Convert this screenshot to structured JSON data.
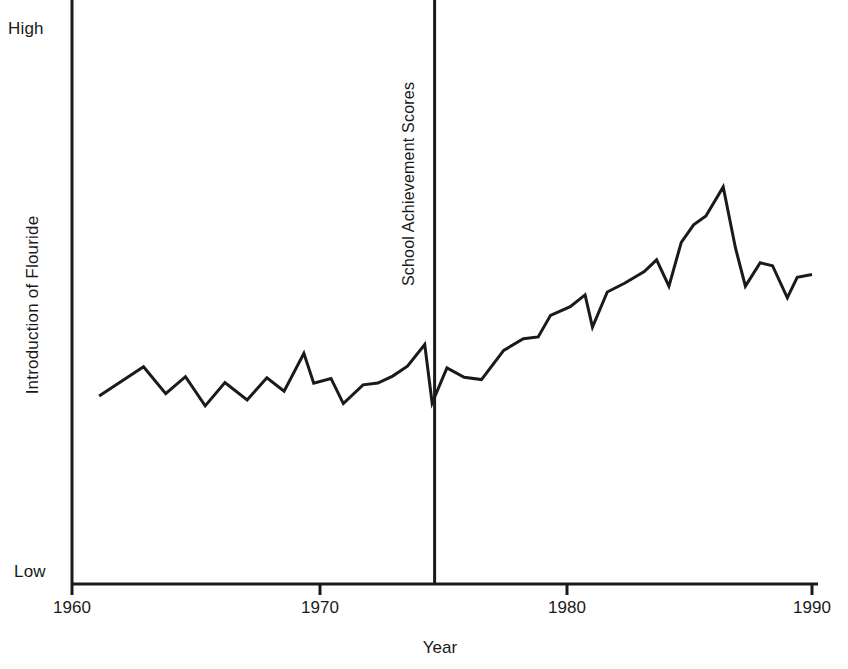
{
  "chart_data": {
    "type": "line",
    "title": "",
    "subtitle": "",
    "xlabel": "Year",
    "ylabel": "Introduction of Flouride",
    "xlim": [
      1960,
      1990
    ],
    "ylim": [
      0,
      100
    ],
    "ytick_labels": [
      "High",
      "Low"
    ],
    "ytick_values": [
      100,
      0
    ],
    "xtick_labels": [
      "1960",
      "1970",
      "1980",
      "1990"
    ],
    "xtick_values": [
      1960,
      1970,
      1980,
      1990
    ],
    "grid": false,
    "legend": "none",
    "series": [
      {
        "name": "School Achievement Scores",
        "x": [
          1961.1,
          1962.9,
          1963.8,
          1964.6,
          1965.4,
          1966.2,
          1967.1,
          1967.9,
          1968.6,
          1969.4,
          1969.8,
          1970.5,
          1971.0,
          1971.8,
          1972.4,
          1973.0,
          1973.6,
          1974.3,
          1974.6,
          1975.2,
          1975.9,
          1976.6,
          1977.5,
          1978.3,
          1978.9,
          1979.4,
          1980.2,
          1980.8,
          1981.1,
          1981.7,
          1982.4,
          1983.2,
          1983.7,
          1984.2,
          1984.7,
          1985.2,
          1985.7,
          1986.4,
          1986.9,
          1987.3,
          1987.9,
          1988.4,
          1989.0,
          1989.4,
          1990.0
        ],
        "y": [
          32.2,
          37.2,
          32.6,
          35.5,
          30.5,
          34.5,
          31.5,
          35.3,
          33.0,
          39.5,
          34.4,
          35.2,
          30.9,
          34.1,
          34.4,
          35.6,
          37.3,
          41.0,
          31.0,
          37.0,
          35.4,
          35.0,
          40.0,
          42.0,
          42.3,
          46.0,
          47.5,
          49.5,
          44.0,
          50.0,
          51.5,
          53.5,
          55.5,
          51.0,
          58.5,
          61.5,
          63.0,
          68.0,
          57.5,
          51.0,
          55.0,
          54.5,
          49.0,
          52.5,
          53.0
        ]
      }
    ],
    "annotations": [
      {
        "name": "vertical-reference-line",
        "label": "School Achievement Scores",
        "x": 1974.7,
        "orientation": "vertical"
      }
    ]
  },
  "axes": {
    "y_top_label": "High",
    "y_bottom_label": "Low",
    "y_axis_title": "Introduction of Flouride",
    "x_axis_title": "Year",
    "x_ticks": [
      "1960",
      "1970",
      "1980",
      "1990"
    ]
  },
  "colors": {
    "line": "#1a1a1a",
    "axis": "#1a1a1a",
    "background": "#ffffff"
  }
}
